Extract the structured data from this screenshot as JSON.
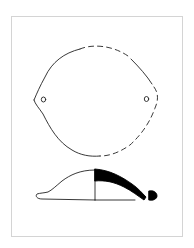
{
  "figure": {
    "type": "archaeological-artifact-drawing",
    "views": [
      {
        "name": "plan-view",
        "description": "Rounded outline with two perforations; dashed sections indicate reconstructed edge"
      },
      {
        "name": "profile-section",
        "description": "Side profile; left half exterior outline, right half solid black cross-section"
      }
    ],
    "colors": {
      "frame": "#d4d4d4",
      "line": "#222222",
      "fill": "#000000",
      "background": "#ffffff"
    }
  }
}
